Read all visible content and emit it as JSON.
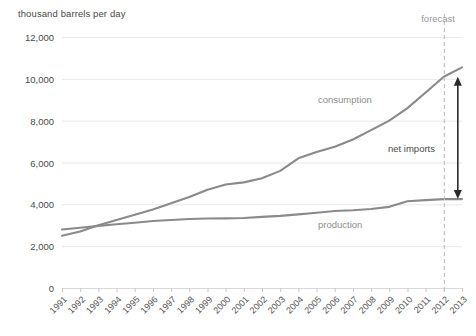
{
  "chart_data": {
    "type": "line",
    "title": "",
    "ylabel": "thousand barrels per day",
    "xlabel": "",
    "ylim": [
      0,
      12000
    ],
    "yticks": [
      0,
      2000,
      4000,
      6000,
      8000,
      10000,
      12000
    ],
    "ytick_labels": [
      "0",
      "2,000",
      "4,000",
      "6,000",
      "8,000",
      "10,000",
      "12,000"
    ],
    "grid": true,
    "legend": "inline-series-labels",
    "x": [
      1991,
      1992,
      1993,
      1994,
      1995,
      1996,
      1997,
      1998,
      1999,
      2000,
      2001,
      2002,
      2003,
      2004,
      2005,
      2006,
      2007,
      2008,
      2009,
      2010,
      2011,
      2012,
      2013
    ],
    "xtick_labels": [
      "1991",
      "1992",
      "1993",
      "1994",
      "1995",
      "1996",
      "1997",
      "1998",
      "1999",
      "2000",
      "2001",
      "2002",
      "2003",
      "2004",
      "2005",
      "2006",
      "2007",
      "2008",
      "2009",
      "2010",
      "2011",
      "2012",
      "2013"
    ],
    "series": [
      {
        "name": "consumption",
        "label": "consumption",
        "color": "#8a8a8a",
        "values": [
          2500,
          2700,
          3000,
          3250,
          3500,
          3750,
          4050,
          4350,
          4700,
          4950,
          5050,
          5250,
          5600,
          6200,
          6500,
          6750,
          7100,
          7550,
          8000,
          8600,
          9350,
          10100,
          10550
        ]
      },
      {
        "name": "production",
        "label": "production",
        "color": "#8a8a8a",
        "values": [
          2800,
          2880,
          2970,
          3050,
          3120,
          3200,
          3250,
          3300,
          3320,
          3330,
          3350,
          3400,
          3450,
          3520,
          3600,
          3680,
          3720,
          3780,
          3880,
          4150,
          4200,
          4250,
          4250
        ]
      }
    ],
    "annotations": [
      {
        "name": "forecast",
        "label": "forecast",
        "at_x": 2012
      },
      {
        "name": "net-imports",
        "label": "net imports",
        "at_x": 2012,
        "from": 4250,
        "to": 10100
      }
    ],
    "forecast_divider_year": 2012
  },
  "colors": {
    "line": "#8a8a8a",
    "grid": "#e8e8e8",
    "axis": "#d9d9d9",
    "arrow": "#2a2a2a",
    "series_label": "#8c8c8c",
    "forecast_label": "#9a9a9a",
    "tick_text": "#4a4a4a"
  }
}
